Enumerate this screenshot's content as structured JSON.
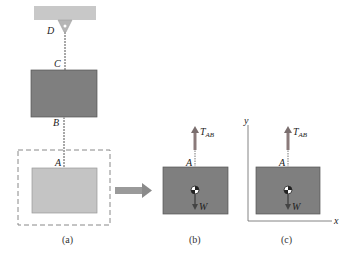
{
  "figure": {
    "panels": [
      {
        "id": "a",
        "caption": "(a)"
      },
      {
        "id": "b",
        "caption": "(b)"
      },
      {
        "id": "c",
        "caption": "(c)"
      }
    ],
    "points": {
      "D": "D",
      "C": "C",
      "B": "B",
      "A": "A"
    },
    "forces": {
      "tension": "T",
      "tension_sub": "AB",
      "weight": "W"
    },
    "axes": {
      "x": "x",
      "y": "y"
    },
    "colors": {
      "box_dark": "#7f7f7f",
      "box_light": "#c4c4c4",
      "ceiling": "#c8c8c8",
      "arrow": "#8a8a8a",
      "force_arrow": "#7a7a7a"
    }
  }
}
